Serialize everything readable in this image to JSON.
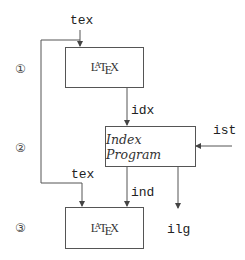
{
  "diagram": {
    "steps": [
      {
        "marker": "①"
      },
      {
        "marker": "②"
      },
      {
        "marker": "③"
      }
    ],
    "nodes": {
      "latex_top": {
        "label_parts": [
          "L",
          "A",
          "T",
          "E",
          "X"
        ]
      },
      "index_program": {
        "label": "Index Program"
      },
      "latex_bottom": {
        "label_parts": [
          "L",
          "A",
          "T",
          "E",
          "X"
        ]
      }
    },
    "edges": {
      "tex_in": {
        "label": "tex"
      },
      "idx": {
        "label": "idx"
      },
      "ist": {
        "label": "ist"
      },
      "tex_reuse": {
        "label": "tex"
      },
      "ind": {
        "label": "ind"
      },
      "ilg": {
        "label": "ilg"
      }
    },
    "colors": {
      "line": "#555555",
      "text": "#222222"
    }
  }
}
